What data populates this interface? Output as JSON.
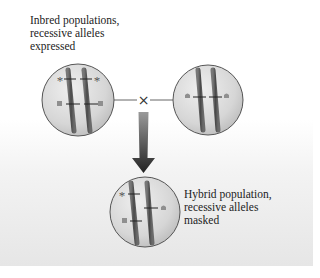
{
  "labels": {
    "inbred": [
      "Inbred populations,",
      "recessive alleles",
      "expressed"
    ],
    "hybrid": [
      "Hybrid population,",
      "recessive alleles",
      "masked"
    ]
  },
  "symbols": {
    "cross": "×",
    "asterisk": "*"
  },
  "colors": {
    "cell_fill_light": "#e9e9e9",
    "cell_fill_dark": "#c4c4c4",
    "cell_stroke": "#555555",
    "chromosome": "#5a5a5a",
    "arrow_top": "#8a8a8a",
    "arrow_bottom": "#2a2a2a",
    "marker": "#8f8f8f"
  },
  "cells": [
    {
      "name": "inbred-cell-left",
      "cx": 78,
      "cy": 100,
      "r": 36
    },
    {
      "name": "inbred-cell-right",
      "cx": 208,
      "cy": 100,
      "r": 35
    },
    {
      "name": "hybrid-cell",
      "cx": 145,
      "cy": 212,
      "r": 35
    }
  ]
}
